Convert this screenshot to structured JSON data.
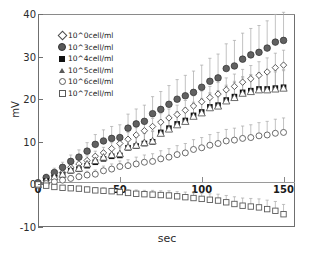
{
  "chart_data": {
    "type": "scatter",
    "title": "",
    "xlabel": "sec",
    "ylabel": "mV",
    "xlim": [
      0,
      157
    ],
    "ylim": [
      -10,
      40
    ],
    "xticks": [
      0,
      50,
      100,
      150
    ],
    "yticks": [
      -10,
      0,
      10,
      20,
      30,
      40
    ],
    "grid": false,
    "legend_position": "upper-left",
    "error_bars": true,
    "x": [
      0,
      5,
      10,
      15,
      20,
      25,
      30,
      35,
      40,
      45,
      50,
      55,
      60,
      65,
      70,
      75,
      80,
      85,
      90,
      95,
      100,
      105,
      110,
      115,
      120,
      125,
      130,
      135,
      140,
      145,
      150
    ],
    "series": [
      {
        "name": "10^0cell/ml",
        "marker": "diamond-open",
        "color": "#4a4a4a",
        "values": [
          0.2,
          1.0,
          2.0,
          2.8,
          4.0,
          4.8,
          5.6,
          6.6,
          7.4,
          8.4,
          9.6,
          10.6,
          11.6,
          12.6,
          13.6,
          14.6,
          15.6,
          16.4,
          17.4,
          18.4,
          19.4,
          20.4,
          21.2,
          22.2,
          23.0,
          24.0,
          24.8,
          25.6,
          26.4,
          27.4,
          28.0
        ],
        "errors": [
          0.5,
          0.6,
          0.7,
          0.8,
          0.9,
          1.0,
          1.1,
          1.2,
          1.3,
          1.4,
          1.5,
          1.6,
          1.7,
          1.8,
          1.9,
          2.0,
          2.1,
          2.2,
          2.3,
          2.4,
          2.5,
          2.6,
          2.7,
          2.8,
          2.9,
          3.0,
          3.1,
          3.2,
          3.3,
          3.4,
          3.5
        ]
      },
      {
        "name": "10^3cell/ml",
        "marker": "circle-filled",
        "color": "#595959",
        "values": [
          0.4,
          1.6,
          2.8,
          4.0,
          5.4,
          6.4,
          7.8,
          9.4,
          10.2,
          10.8,
          11.0,
          13.2,
          14.2,
          14.8,
          16.6,
          17.6,
          18.8,
          20.0,
          20.8,
          21.6,
          22.8,
          24.2,
          25.0,
          27.2,
          27.8,
          29.4,
          30.4,
          31.0,
          32.0,
          33.4,
          33.8
        ],
        "errors": [
          0.6,
          0.8,
          1.0,
          1.2,
          1.5,
          1.7,
          2.0,
          2.3,
          2.6,
          2.8,
          3.0,
          3.3,
          3.5,
          3.8,
          4.0,
          4.2,
          4.4,
          4.6,
          4.8,
          5.0,
          5.2,
          5.4,
          5.6,
          5.8,
          6.0,
          6.1,
          6.2,
          6.3,
          6.4,
          6.5,
          6.6
        ]
      },
      {
        "name": "10^4cell/ml",
        "marker": "square-filled",
        "color": "#111111",
        "values": [
          0.1,
          0.8,
          1.6,
          2.2,
          3.2,
          3.6,
          4.4,
          5.2,
          6.0,
          6.6,
          6.8,
          8.6,
          9.0,
          9.6,
          10.0,
          12.2,
          13.2,
          14.2,
          15.0,
          16.2,
          17.0,
          18.2,
          18.6,
          19.8,
          20.6,
          21.6,
          22.0,
          22.4,
          22.4,
          22.6,
          22.8
        ],
        "errors": [
          0.4,
          0.5,
          0.6,
          0.8,
          0.9,
          1.1,
          1.2,
          1.4,
          1.5,
          1.7,
          1.8,
          2.0,
          2.1,
          2.3,
          2.4,
          2.6,
          2.7,
          2.9,
          3.0,
          3.1,
          3.2,
          3.3,
          3.4,
          3.5,
          3.6,
          3.7,
          3.8,
          3.9,
          4.0,
          4.1,
          4.2
        ]
      },
      {
        "name": "10^5cell/ml",
        "marker": "triangle-open",
        "color": "#5a5a5a",
        "values": [
          0.0,
          0.9,
          1.8,
          2.4,
          3.4,
          3.8,
          4.8,
          5.6,
          6.4,
          7.0,
          7.2,
          8.8,
          9.2,
          9.8,
          10.2,
          12.0,
          13.0,
          14.0,
          14.8,
          16.0,
          16.8,
          18.0,
          18.4,
          19.6,
          20.4,
          21.4,
          21.8,
          22.2,
          22.2,
          22.4,
          22.6
        ],
        "errors": [
          0.4,
          0.5,
          0.6,
          0.7,
          0.9,
          1.0,
          1.2,
          1.3,
          1.5,
          1.6,
          1.8,
          1.9,
          2.1,
          2.2,
          2.4,
          2.5,
          2.6,
          2.8,
          2.9,
          3.0,
          3.1,
          3.2,
          3.3,
          3.4,
          3.5,
          3.6,
          3.7,
          3.8,
          3.9,
          4.0,
          4.1
        ]
      },
      {
        "name": "10^6cell/ml",
        "marker": "circle-open",
        "color": "#5a5a5a",
        "values": [
          -0.2,
          0.2,
          0.6,
          1.0,
          1.4,
          1.8,
          2.2,
          2.4,
          3.2,
          3.6,
          4.2,
          4.4,
          4.8,
          5.2,
          5.4,
          6.0,
          6.4,
          7.0,
          7.4,
          8.2,
          8.6,
          9.2,
          9.6,
          10.2,
          10.4,
          10.8,
          11.0,
          11.4,
          11.6,
          12.0,
          12.2
        ],
        "errors": [
          0.3,
          0.4,
          0.5,
          0.6,
          0.7,
          0.8,
          0.9,
          1.0,
          1.1,
          1.2,
          1.3,
          1.4,
          1.6,
          1.7,
          1.8,
          1.9,
          2.0,
          2.1,
          2.2,
          2.3,
          2.4,
          2.5,
          2.6,
          2.7,
          2.8,
          2.9,
          3.0,
          3.1,
          3.2,
          3.3,
          3.4
        ]
      },
      {
        "name": "10^7cell/ml",
        "marker": "square-open",
        "color": "#5a5a5a",
        "values": [
          0.0,
          -0.3,
          -0.6,
          -0.8,
          -0.9,
          -1.0,
          -1.2,
          -1.4,
          -1.5,
          -1.6,
          -1.8,
          -2.0,
          -2.2,
          -2.3,
          -2.4,
          -2.5,
          -2.6,
          -2.8,
          -3.0,
          -3.2,
          -3.4,
          -3.6,
          -3.8,
          -4.2,
          -4.6,
          -5.0,
          -5.2,
          -5.4,
          -5.8,
          -6.2,
          -7.0
        ],
        "errors": [
          0.3,
          0.3,
          0.4,
          0.4,
          0.5,
          0.5,
          0.6,
          0.6,
          0.7,
          0.7,
          0.8,
          0.8,
          0.9,
          0.9,
          1.0,
          1.0,
          1.1,
          1.1,
          1.2,
          1.2,
          1.3,
          1.4,
          1.5,
          1.6,
          1.7,
          1.8,
          1.9,
          2.0,
          2.1,
          2.2,
          2.3
        ]
      }
    ]
  },
  "legend": {
    "items": [
      {
        "label": "10^0cell/ml",
        "marker": "diamond-open"
      },
      {
        "label": "10^3cell/ml",
        "marker": "circle-filled"
      },
      {
        "label": "10^4cell/ml",
        "marker": "square-filled"
      },
      {
        "label": "10^5cell/ml",
        "marker": "triangle-open"
      },
      {
        "label": "10^6cell/ml",
        "marker": "circle-open"
      },
      {
        "label": "10^7cell/ml",
        "marker": "square-open"
      }
    ]
  },
  "axes": {
    "ylabel": "mV",
    "xlabel": "sec",
    "ytick_labels": [
      "40",
      "30",
      "20",
      "10",
      "0",
      "-10"
    ],
    "xtick_labels": [
      "0",
      "50",
      "100",
      "150"
    ]
  },
  "colors": {
    "axis": "#6f6f6f",
    "zero_line": "#9a9a9a",
    "text": "#1a1a1a",
    "background": "#ffffff"
  }
}
